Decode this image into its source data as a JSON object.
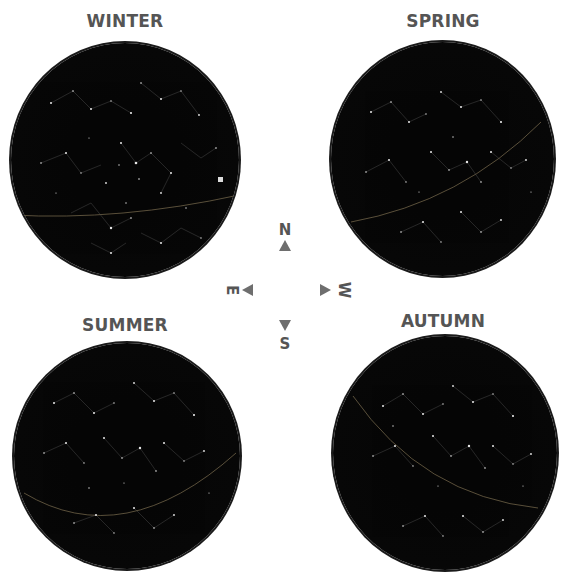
{
  "seasons": [
    {
      "label": "WINTER",
      "position": "top-left"
    },
    {
      "label": "SPRING",
      "position": "top-right"
    },
    {
      "label": "SUMMER",
      "position": "bottom-left"
    },
    {
      "label": "AUTUMN",
      "position": "bottom-right"
    }
  ],
  "compass": {
    "north": "N",
    "south": "S",
    "east": "E",
    "west": "W"
  },
  "colors": {
    "label_text": "#555555",
    "arrow": "#6e6e6e",
    "sky": "#050505",
    "ecliptic": "#8a7a5a",
    "stars": "#e8e8e8"
  }
}
